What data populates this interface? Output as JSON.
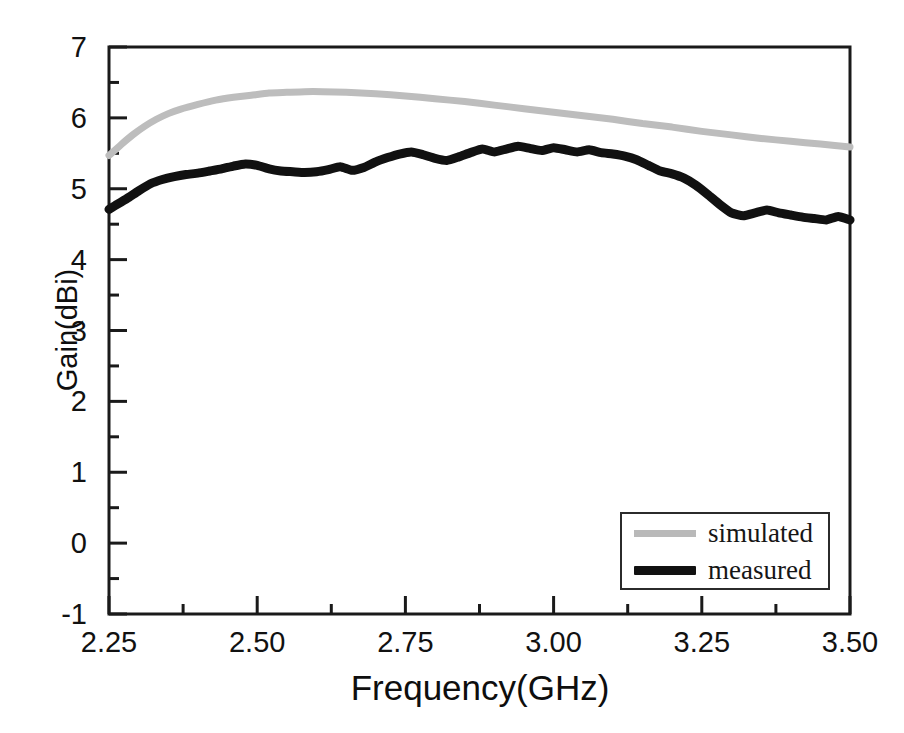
{
  "chart_data": {
    "type": "line",
    "title": "",
    "xlabel": "Frequency(GHz)",
    "ylabel": "Gain(dBi)",
    "xlim": [
      2.25,
      3.5
    ],
    "ylim": [
      -1,
      7
    ],
    "xticks": [
      "2.25",
      "2.50",
      "2.75",
      "3.00",
      "3.25",
      "3.50"
    ],
    "xtick_values": [
      2.25,
      2.5,
      2.75,
      3.0,
      3.25,
      3.5
    ],
    "x_minor_tick_step": 0.125,
    "yticks": [
      "-1",
      "0",
      "1",
      "2",
      "3",
      "4",
      "5",
      "6",
      "7"
    ],
    "ytick_values": [
      -1,
      0,
      1,
      2,
      3,
      4,
      5,
      6,
      7
    ],
    "y_minor_tick_step": 0.5,
    "grid": false,
    "legend_position": "lower right",
    "legend_entries": [
      "simulated",
      "measured"
    ],
    "x": [
      2.25,
      2.275,
      2.3,
      2.325,
      2.35,
      2.375,
      2.4,
      2.425,
      2.45,
      2.475,
      2.5,
      2.525,
      2.55,
      2.575,
      2.6,
      2.625,
      2.65,
      2.675,
      2.7,
      2.725,
      2.75,
      2.775,
      2.8,
      2.825,
      2.85,
      2.875,
      2.9,
      2.925,
      2.95,
      2.975,
      3.0,
      3.025,
      3.05,
      3.075,
      3.1,
      3.125,
      3.15,
      3.175,
      3.2,
      3.225,
      3.25,
      3.275,
      3.3,
      3.325,
      3.35,
      3.375,
      3.4,
      3.425,
      3.45,
      3.475,
      3.5
    ],
    "series": [
      {
        "name": "simulated",
        "color": "#bdbdbd",
        "width": 7,
        "values": [
          5.47,
          5.66,
          5.82,
          5.95,
          6.05,
          6.13,
          6.19,
          6.24,
          6.28,
          6.31,
          6.34,
          6.355,
          6.36,
          6.36,
          6.355,
          6.35,
          6.34,
          6.33,
          6.32,
          6.3,
          6.28,
          6.26,
          6.24,
          6.22,
          6.2,
          6.18,
          6.16,
          6.14,
          6.12,
          6.1,
          6.07,
          6.04,
          6.01,
          5.99,
          5.96,
          5.93,
          5.9,
          5.87,
          5.84,
          5.81,
          5.79,
          5.76,
          5.73,
          5.71,
          5.69,
          5.67,
          5.65,
          5.63,
          5.61,
          5.6,
          5.59
        ]
      },
      {
        "name": "measured",
        "color": "#111111",
        "width": 9,
        "values": [
          4.71,
          4.81,
          4.93,
          5.03,
          5.11,
          5.17,
          5.21,
          5.24,
          5.27,
          5.3,
          5.33,
          5.31,
          5.27,
          5.24,
          5.22,
          5.22,
          5.24,
          5.29,
          5.22,
          5.32,
          5.4,
          5.47,
          5.51,
          5.48,
          5.43,
          5.39,
          5.44,
          5.5,
          5.55,
          5.58,
          5.62,
          5.6,
          5.57,
          5.56,
          5.58,
          5.55,
          5.57,
          5.55,
          5.56,
          5.52,
          5.48,
          5.46,
          5.42,
          5.38,
          5.3,
          5.24,
          5.26,
          5.22,
          5.18,
          5.12,
          5.05
        ]
      }
    ],
    "series_extended": {
      "measured_detail": {
        "x": [
          2.25,
          2.26,
          2.28,
          2.3,
          2.32,
          2.34,
          2.36,
          2.38,
          2.4,
          2.42,
          2.44,
          2.46,
          2.48,
          2.5,
          2.52,
          2.54,
          2.56,
          2.58,
          2.6,
          2.62,
          2.64,
          2.66,
          2.68,
          2.7,
          2.72,
          2.74,
          2.76,
          2.78,
          2.8,
          2.82,
          2.84,
          2.86,
          2.88,
          2.9,
          2.92,
          2.94,
          2.96,
          2.98,
          3.0,
          3.02,
          3.04,
          3.06,
          3.08,
          3.1,
          3.12,
          3.14,
          3.16,
          3.18,
          3.2,
          3.22,
          3.24,
          3.26,
          3.28,
          3.3,
          3.32,
          3.34,
          3.36,
          3.38,
          3.4,
          3.42,
          3.44,
          3.46,
          3.48,
          3.5
        ],
        "y": [
          4.71,
          4.76,
          4.86,
          4.97,
          5.07,
          5.13,
          5.17,
          5.2,
          5.22,
          5.25,
          5.28,
          5.32,
          5.35,
          5.33,
          5.28,
          5.25,
          5.24,
          5.23,
          5.24,
          5.27,
          5.31,
          5.26,
          5.3,
          5.38,
          5.44,
          5.49,
          5.52,
          5.48,
          5.43,
          5.4,
          5.45,
          5.51,
          5.56,
          5.52,
          5.56,
          5.6,
          5.57,
          5.54,
          5.58,
          5.55,
          5.52,
          5.55,
          5.51,
          5.49,
          5.46,
          5.41,
          5.33,
          5.25,
          5.21,
          5.15,
          5.05,
          4.92,
          4.78,
          4.66,
          4.62,
          4.66,
          4.7,
          4.66,
          4.63,
          4.6,
          4.58,
          4.56,
          4.61,
          4.56
        ]
      },
      "simulated_detail": {
        "x": [
          2.25,
          2.27,
          2.29,
          2.31,
          2.33,
          2.35,
          2.37,
          2.4,
          2.43,
          2.46,
          2.49,
          2.52,
          2.55,
          2.58,
          2.61,
          2.65,
          2.7,
          2.75,
          2.8,
          2.85,
          2.9,
          2.95,
          3.0,
          3.05,
          3.1,
          3.15,
          3.2,
          3.25,
          3.3,
          3.35,
          3.4,
          3.45,
          3.5
        ],
        "y": [
          5.47,
          5.62,
          5.76,
          5.88,
          5.98,
          6.06,
          6.12,
          6.19,
          6.25,
          6.29,
          6.32,
          6.35,
          6.36,
          6.37,
          6.37,
          6.36,
          6.34,
          6.31,
          6.27,
          6.23,
          6.18,
          6.13,
          6.08,
          6.03,
          5.98,
          5.92,
          5.87,
          5.81,
          5.76,
          5.71,
          5.67,
          5.63,
          5.59
        ]
      }
    }
  },
  "axes": {
    "x_title": "Frequency(GHz)",
    "y_title": "Gain(dBi)",
    "x_tick_labels": [
      "2.25",
      "2.50",
      "2.75",
      "3.00",
      "3.25",
      "3.50"
    ],
    "y_tick_labels": [
      "7",
      "6",
      "5",
      "4",
      "3",
      "2",
      "1",
      "0",
      "-1"
    ]
  },
  "legend": {
    "items": [
      {
        "label": "simulated",
        "swatch": "gray-line-swatch"
      },
      {
        "label": "measured",
        "swatch": "black-line-swatch"
      }
    ]
  },
  "colors": {
    "axis": "#1a1a1a",
    "simulated": "#bdbdbd",
    "measured": "#111111",
    "background": "#ffffff"
  }
}
